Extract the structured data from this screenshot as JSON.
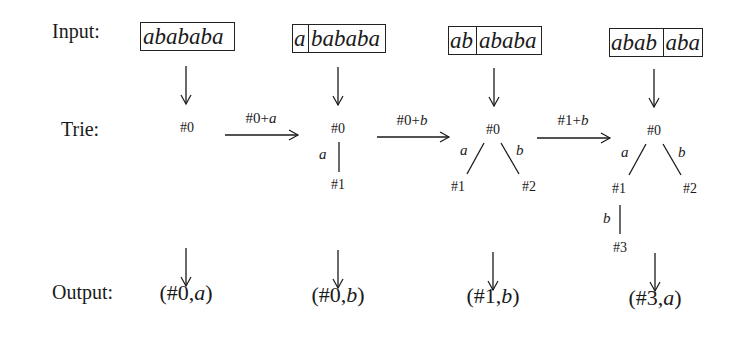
{
  "labels": {
    "input": "Input:",
    "trie": "Trie:",
    "output": "Output:"
  },
  "steps": [
    {
      "input_segments": [
        "abababa"
      ],
      "input_parts": [
        "",
        "abababa"
      ],
      "trie_nodes": [
        "#0"
      ],
      "output": {
        "prefix": "(#0,",
        "char": "a",
        "suffix": ")"
      }
    },
    {
      "input_parts": [
        "a",
        "bababa"
      ],
      "transition_from_prev": {
        "ref": "#0+",
        "char": "a"
      },
      "trie_nodes": [
        "#0",
        "#1"
      ],
      "trie_edges": [
        {
          "from": "#0",
          "to": "#1",
          "label": "a"
        }
      ],
      "output": {
        "prefix": "(#0,",
        "char": "b",
        "suffix": ")"
      }
    },
    {
      "input_parts": [
        "ab",
        "ababa"
      ],
      "transition_from_prev": {
        "ref": "#0+",
        "char": "b"
      },
      "trie_nodes": [
        "#0",
        "#1",
        "#2"
      ],
      "trie_edges": [
        {
          "from": "#0",
          "to": "#1",
          "label": "a"
        },
        {
          "from": "#0",
          "to": "#2",
          "label": "b"
        }
      ],
      "output": {
        "prefix": "(#1,",
        "char": "b",
        "suffix": ")"
      }
    },
    {
      "input_parts": [
        "abab",
        "aba"
      ],
      "transition_from_prev": {
        "ref": "#1+",
        "char": "b"
      },
      "trie_nodes": [
        "#0",
        "#1",
        "#2",
        "#3"
      ],
      "trie_edges": [
        {
          "from": "#0",
          "to": "#1",
          "label": "a"
        },
        {
          "from": "#0",
          "to": "#2",
          "label": "b"
        },
        {
          "from": "#1",
          "to": "#3",
          "label": "b"
        }
      ],
      "output": {
        "prefix": "(#3,",
        "char": "a",
        "suffix": ")"
      }
    }
  ],
  "colors": {
    "ink": "#1a1a1a",
    "background": "#ffffff"
  }
}
